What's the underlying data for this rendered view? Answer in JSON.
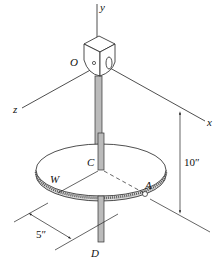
{
  "diagram": {
    "labels": {
      "y": "y",
      "x": "x",
      "z": "z",
      "O": "O",
      "C": "C",
      "W": "W",
      "A": "A",
      "D": "D",
      "dim_height": "10″",
      "dim_radius": "5″"
    }
  }
}
